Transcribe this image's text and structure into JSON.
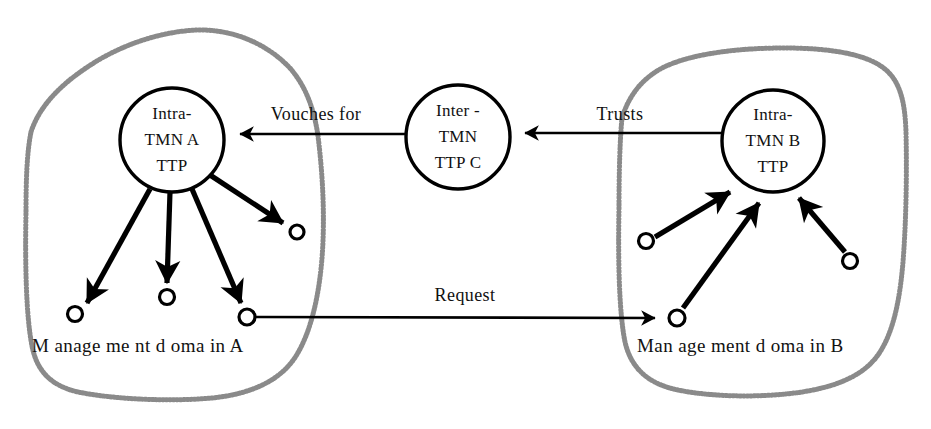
{
  "diagram": {
    "type": "node-link-diagram",
    "colors": {
      "stroke": "#000000",
      "background": "#ffffff",
      "domain_boundary": "#8a8a8a",
      "text": "#111111"
    },
    "ttp_nodes": [
      {
        "id": "intra-tmn-a-ttp",
        "lines": [
          "Intra-",
          "TMN A",
          "TTP"
        ],
        "cx": 172,
        "cy": 140,
        "r": 52
      },
      {
        "id": "inter-tmn-ttp-c",
        "lines": [
          "Inter -",
          "TMN",
          "TTP C"
        ],
        "cx": 458,
        "cy": 137,
        "r": 52
      },
      {
        "id": "intra-tmn-b-ttp",
        "lines": [
          "Intra-",
          "TMN B",
          "TTP"
        ],
        "cx": 773,
        "cy": 141,
        "r": 51
      }
    ],
    "edge_labels": [
      {
        "id": "vouches-for",
        "text": "Vouches for",
        "x": 316,
        "y": 120
      },
      {
        "id": "trusts",
        "text": "Trusts",
        "x": 620,
        "y": 120
      },
      {
        "id": "request",
        "text": "Request",
        "x": 465,
        "y": 301
      }
    ],
    "domain_labels": [
      {
        "id": "management-domain-a",
        "text": "M anage me nt d oma in  A",
        "x": 32,
        "y": 352
      },
      {
        "id": "management-domain-b",
        "text": "Man age ment d oma in  B",
        "x": 637,
        "y": 352
      }
    ],
    "endpoints": [
      {
        "id": "endpoint-a-upper-right",
        "cx": 297,
        "cy": 232,
        "r": 7
      },
      {
        "id": "endpoint-a-left",
        "cx": 75,
        "cy": 314,
        "r": 7.5
      },
      {
        "id": "endpoint-a-middle",
        "cx": 167,
        "cy": 297,
        "r": 7.5
      },
      {
        "id": "endpoint-a-right",
        "cx": 247,
        "cy": 317,
        "r": 8
      },
      {
        "id": "endpoint-b-left",
        "cx": 646,
        "cy": 241,
        "r": 7.5
      },
      {
        "id": "endpoint-b-bottom",
        "cx": 677,
        "cy": 318,
        "r": 8
      },
      {
        "id": "endpoint-b-right",
        "cx": 850,
        "cy": 261,
        "r": 7.5
      }
    ],
    "connections": [
      {
        "id": "edge-c-to-a",
        "label": "Vouches for",
        "from": "inter-tmn-ttp-c",
        "to": "intra-tmn-a-ttp",
        "direction": "left"
      },
      {
        "id": "edge-b-to-c",
        "label": "Trusts",
        "from": "intra-tmn-b-ttp",
        "to": "inter-tmn-ttp-c",
        "direction": "left"
      },
      {
        "id": "edge-request",
        "label": "Request",
        "from": "endpoint-a-right",
        "to": "endpoint-b-bottom",
        "direction": "right"
      },
      {
        "id": "edge-a-to-endpoint-upper-right",
        "from": "intra-tmn-a-ttp",
        "to": "endpoint-a-upper-right"
      },
      {
        "id": "edge-a-to-endpoint-left",
        "from": "intra-tmn-a-ttp",
        "to": "endpoint-a-left"
      },
      {
        "id": "edge-a-to-endpoint-middle",
        "from": "intra-tmn-a-ttp",
        "to": "endpoint-a-middle"
      },
      {
        "id": "edge-a-to-endpoint-right",
        "from": "intra-tmn-a-ttp",
        "to": "endpoint-a-right"
      },
      {
        "id": "edge-endpoint-left-to-b",
        "from": "endpoint-b-left",
        "to": "intra-tmn-b-ttp"
      },
      {
        "id": "edge-endpoint-bottom-to-b",
        "from": "endpoint-b-bottom",
        "to": "intra-tmn-b-ttp"
      },
      {
        "id": "edge-endpoint-right-to-b",
        "from": "endpoint-b-right",
        "to": "intra-tmn-b-ttp"
      }
    ]
  }
}
